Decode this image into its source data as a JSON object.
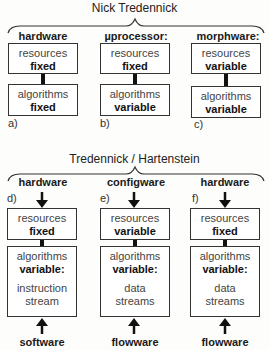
{
  "top": {
    "title": "Nick Tredennick",
    "columns": [
      {
        "header": "hardware",
        "tag": "a)",
        "resources_label": "resources",
        "resources_value": "fixed",
        "algorithms_label": "algorithms",
        "algorithms_value": "fixed"
      },
      {
        "header": "µprocessor:",
        "tag": "b)",
        "resources_label": "resources",
        "resources_value": "fixed",
        "algorithms_label": "algorithms",
        "algorithms_value": "variable"
      },
      {
        "header": "morphware:",
        "tag": "c)",
        "resources_label": "resources",
        "resources_value": "variable",
        "algorithms_label": "algorithms",
        "algorithms_value": "variable"
      }
    ]
  },
  "bottom": {
    "title": "Tredennick / Hartenstein",
    "columns": [
      {
        "header": "hardware",
        "tag": "d)",
        "resources_label": "resources",
        "resources_value": "fixed",
        "algorithms_label": "algorithms",
        "algorithms_value": "variable:",
        "detail_line1": "instruction",
        "detail_line2": "stream",
        "footer": "software"
      },
      {
        "header": "configware",
        "tag": "e)",
        "resources_label": "resources",
        "resources_value": "variable",
        "algorithms_label": "algorithms",
        "algorithms_value": "variable:",
        "detail_line1": "data",
        "detail_line2": "streams",
        "footer": "flowware"
      },
      {
        "header": "hardware",
        "tag": "f)",
        "resources_label": "resources",
        "resources_value": "fixed",
        "algorithms_label": "algorithms",
        "algorithms_value": "variable:",
        "detail_line1": "data",
        "detail_line2": "streams",
        "footer": "flowware"
      }
    ]
  }
}
